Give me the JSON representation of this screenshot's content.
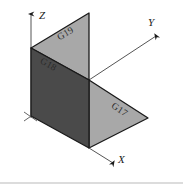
{
  "figure": {
    "type": "isometric-3d-diagram",
    "background_color": "#ffffff",
    "outline_color": "#1a1a1a",
    "axes": {
      "z": {
        "label": "Z",
        "direction": "up"
      },
      "y": {
        "label": "Y",
        "direction": "upper-right"
      },
      "x": {
        "label": "X",
        "direction": "lower-right"
      }
    },
    "faces": [
      {
        "id": "G19",
        "label": "G19",
        "description": "upper vertical triangular panel",
        "fill_color": "#a8a8a8",
        "points": "31,48 89,13 89,80"
      },
      {
        "id": "G18",
        "label": "G18",
        "description": "left dark vertical panel",
        "fill_color": "#4a4a4a",
        "points": "31,48 89,80 89,148 31,116"
      },
      {
        "id": "G17",
        "label": "G17",
        "description": "lower right horizontal panel",
        "fill_color": "#a8a8a8",
        "points": "89,80 148,118 89,148"
      }
    ],
    "origin_marker": {
      "x": 31,
      "y": 116,
      "shape": "cross-tick"
    }
  }
}
